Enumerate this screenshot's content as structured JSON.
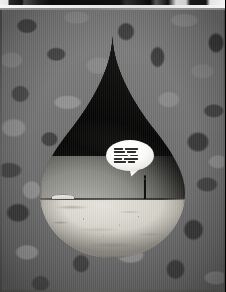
{
  "image": {
    "title": "Surreal grayscale photo-illustration of a water droplet window",
    "medium": "black-and-white photographic montage",
    "background": {
      "name": "mottled camouflage texture",
      "base_color": "#777776",
      "dark_color": "#43433f",
      "light_color": "#90908d"
    },
    "top_strip": {
      "description": "thin film-edge letterbox band along top of frame",
      "light_color": "#efefef",
      "dark_color": "#141414"
    },
    "droplet": {
      "name": "teardrop cutout",
      "tip_color": "#070707",
      "sky_color": "#9e9e99",
      "shadow_color": "#0a0a0a",
      "ground_color": "#ddd9d1",
      "horizon_color": "#2d2c28"
    },
    "figure": {
      "name": "lone standing person silhouette",
      "color": "#101010",
      "position": "right of center, on the horizon line"
    },
    "speech_bubble": {
      "name": "speech bubble with illegible text",
      "fill_color": "#fbfbf9",
      "text_color": "#2e2e2c",
      "line_rows": [
        [
          9,
          13
        ],
        [
          11,
          9
        ],
        [
          14,
          8
        ],
        [
          8,
          14
        ],
        [
          12,
          7
        ]
      ]
    }
  }
}
